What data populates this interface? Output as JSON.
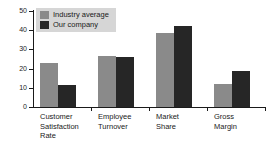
{
  "chart_data": {
    "type": "bar",
    "title": "",
    "subtitle": "",
    "xlabel": "",
    "ylabel": "",
    "ylim": [
      0,
      50
    ],
    "yticks": [
      0,
      10,
      20,
      30,
      40,
      50
    ],
    "grid": false,
    "legend_position": "top-left",
    "categories": [
      "Customer\nSatisfaction\nRate",
      "Employee\nTurnover",
      "Market\nShare",
      "Gross\nMargin"
    ],
    "series": [
      {
        "name": "Industry average",
        "color": "#8a8a8a",
        "values": [
          23,
          26.5,
          38.5,
          12
        ]
      },
      {
        "name": "Our company",
        "color": "#262626",
        "values": [
          11.5,
          26,
          42,
          19
        ]
      }
    ]
  },
  "axis": {
    "tick_labels": [
      "0",
      "10",
      "20",
      "30",
      "40",
      "50"
    ]
  },
  "legend": {
    "entries": [
      {
        "label": "Industry average",
        "color": "#8a8a8a"
      },
      {
        "label": "Our company",
        "color": "#262626"
      }
    ]
  },
  "colors": {
    "background": "#ffffff",
    "axis": "#1a1a1a",
    "text": "#1a1a1a",
    "legend_background": "#d6d6d6",
    "series_industry_average": "#8a8a8a",
    "series_our_company": "#262626"
  }
}
